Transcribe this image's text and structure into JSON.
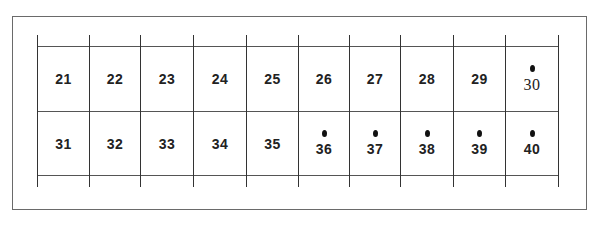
{
  "diagram": {
    "rows": [
      {
        "cells": [
          {
            "label": "21",
            "dot": false,
            "serif": false
          },
          {
            "label": "22",
            "dot": false,
            "serif": false
          },
          {
            "label": "23",
            "dot": false,
            "serif": false
          },
          {
            "label": "24",
            "dot": false,
            "serif": false
          },
          {
            "label": "25",
            "dot": false,
            "serif": false
          },
          {
            "label": "26",
            "dot": false,
            "serif": false
          },
          {
            "label": "27",
            "dot": false,
            "serif": false
          },
          {
            "label": "28",
            "dot": false,
            "serif": false
          },
          {
            "label": "29",
            "dot": false,
            "serif": false
          },
          {
            "label": "30",
            "dot": true,
            "serif": true
          }
        ]
      },
      {
        "cells": [
          {
            "label": "31",
            "dot": false,
            "serif": false
          },
          {
            "label": "32",
            "dot": false,
            "serif": false
          },
          {
            "label": "33",
            "dot": false,
            "serif": false
          },
          {
            "label": "34",
            "dot": false,
            "serif": false
          },
          {
            "label": "35",
            "dot": false,
            "serif": false
          },
          {
            "label": "36",
            "dot": true,
            "serif": false
          },
          {
            "label": "37",
            "dot": true,
            "serif": false
          },
          {
            "label": "38",
            "dot": true,
            "serif": false
          },
          {
            "label": "39",
            "dot": true,
            "serif": false
          },
          {
            "label": "40",
            "dot": true,
            "serif": false
          }
        ]
      }
    ]
  }
}
